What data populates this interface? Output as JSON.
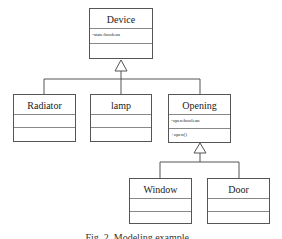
{
  "diagram": {
    "type": "UML class diagram",
    "classes": [
      {
        "name": "Device",
        "attributes": [
          "-state:boolean"
        ],
        "operations": []
      },
      {
        "name": "Radiator",
        "attributes": [],
        "operations": []
      },
      {
        "name": "lamp",
        "attributes": [],
        "operations": []
      },
      {
        "name": "Opening",
        "attributes": [
          "-open:boolean"
        ],
        "operations": [
          "+open()"
        ]
      },
      {
        "name": "Window",
        "attributes": [],
        "operations": []
      },
      {
        "name": "Door",
        "attributes": [],
        "operations": []
      }
    ],
    "relations": [
      {
        "type": "generalization",
        "parent": "Device",
        "children": [
          "Radiator",
          "lamp",
          "Opening"
        ]
      },
      {
        "type": "generalization",
        "parent": "Opening",
        "children": [
          "Window",
          "Door"
        ]
      }
    ]
  },
  "caption": "Fig. 2. Modeling example..."
}
